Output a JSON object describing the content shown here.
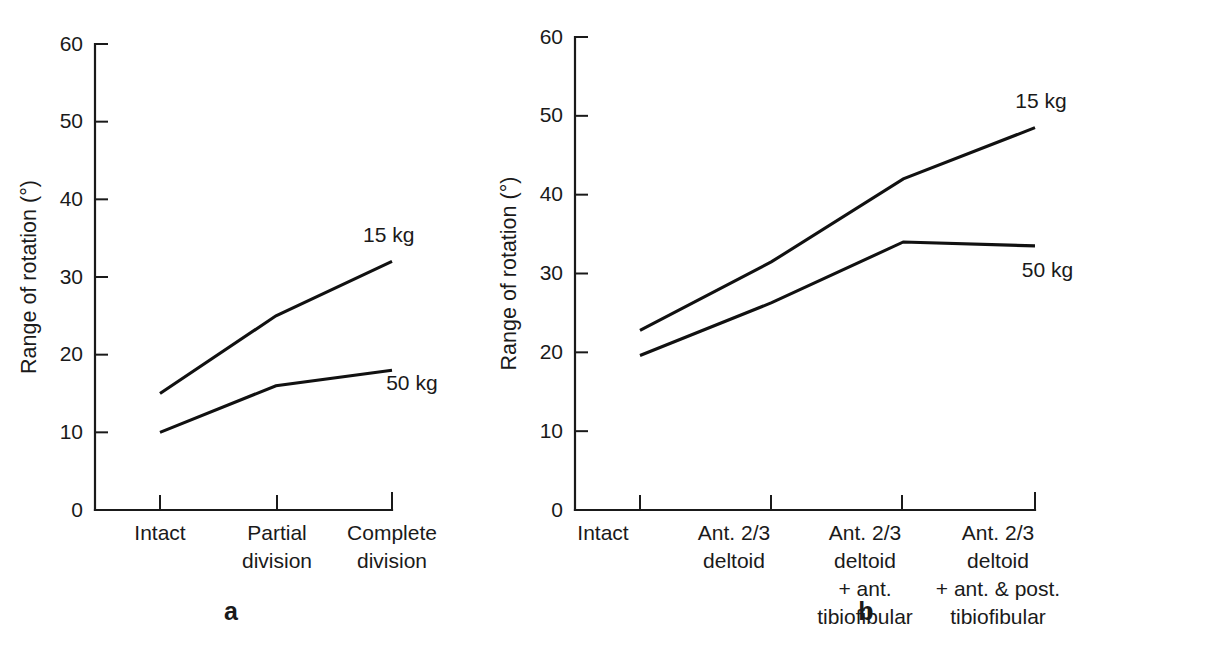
{
  "figure": {
    "panel_a_label": "a",
    "panel_b_label": "b"
  },
  "chart_data": [
    {
      "type": "line",
      "panel": "a",
      "title": "",
      "xlabel": "",
      "ylabel": "Range of rotation (°)",
      "categories": [
        "Intact",
        "Partial division",
        "Complete division"
      ],
      "category_lines": [
        [
          "Intact"
        ],
        [
          "Partial",
          "division"
        ],
        [
          "Complete",
          "division"
        ]
      ],
      "xtick_labels": [
        "Intact",
        "Partial division",
        "Complete division"
      ],
      "yticks": [
        0,
        10,
        20,
        30,
        40,
        50,
        60
      ],
      "ytick_labels": [
        "0",
        "10",
        "20",
        "30",
        "40",
        "50",
        "60"
      ],
      "ylim": [
        0,
        60
      ],
      "grid": false,
      "legend_position": "inline-right",
      "series": [
        {
          "name": "15 kg",
          "values": [
            15.0,
            25.0,
            32.0
          ]
        },
        {
          "name": "50 kg",
          "values": [
            10.0,
            16.0,
            18.0
          ]
        }
      ],
      "annotations": [
        {
          "text": "15 kg",
          "value": 34.5,
          "category_index": 1.75
        },
        {
          "text": "50 kg",
          "value": 15.5,
          "category_index": 1.95
        }
      ]
    },
    {
      "type": "line",
      "panel": "b",
      "title": "",
      "xlabel": "",
      "ylabel": "Range of rotation (°)",
      "categories": [
        "Intact",
        "Ant. 2/3 deltoid",
        "Ant. 2/3 deltoid + ant. tibiofibular",
        "Ant. 2/3 deltoid + ant. & post. tibiofibular"
      ],
      "category_lines": [
        [
          "Intact"
        ],
        [
          "Ant. 2/3",
          "deltoid"
        ],
        [
          "Ant. 2/3",
          "deltoid",
          "+ ant.",
          "tibiofibular"
        ],
        [
          "Ant. 2/3",
          "deltoid",
          "+ ant. & post.",
          "tibiofibular"
        ]
      ],
      "xtick_labels": [
        "Intact",
        "Ant. 2/3 deltoid",
        "Ant. 2/3 deltoid + ant. tibiofibular",
        "Ant. 2/3 deltoid + ant. & post. tibiofibular"
      ],
      "yticks": [
        0,
        10,
        20,
        30,
        40,
        50,
        60
      ],
      "ytick_labels": [
        "0",
        "10",
        "20",
        "30",
        "40",
        "50",
        "60"
      ],
      "ylim": [
        0,
        60
      ],
      "grid": false,
      "legend_position": "inline-right",
      "series": [
        {
          "name": "15 kg",
          "values": [
            22.8,
            31.5,
            42.0,
            48.5
          ]
        },
        {
          "name": "50 kg",
          "values": [
            19.6,
            26.3,
            34.0,
            33.5
          ]
        }
      ],
      "annotations": [
        {
          "text": "15 kg",
          "value": 51.0,
          "category_index": 2.85
        },
        {
          "text": "50 kg",
          "value": 29.5,
          "category_index": 2.9
        }
      ]
    }
  ],
  "colors": {
    "ink": "#1a1a1a",
    "line": "#111111",
    "background": "#ffffff"
  }
}
